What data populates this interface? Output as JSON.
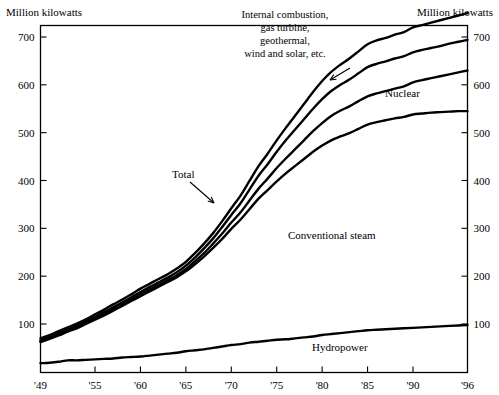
{
  "chart_data": {
    "type": "line",
    "title": "",
    "subtitle": "",
    "xlabel": "",
    "ylabel": "Million kilowatts",
    "ylabel_right": "Million kilowatts",
    "xlim": [
      1949,
      1996
    ],
    "ylim": [
      0,
      740
    ],
    "grid": false,
    "legend_position": "inline-labels",
    "ytick_labels": [
      "700",
      "600",
      "500",
      "400",
      "300",
      "200",
      "100"
    ],
    "ytick_values": [
      700,
      600,
      500,
      400,
      300,
      200,
      100
    ],
    "xtick_labels": [
      "'49",
      "'55",
      "'60",
      "'65",
      "'70",
      "'75",
      "'80",
      "'85",
      "'90",
      "'96"
    ],
    "xtick_values": [
      1949,
      1955,
      1960,
      1965,
      1970,
      1975,
      1980,
      1985,
      1990,
      1996
    ],
    "x": [
      1949,
      1950,
      1951,
      1952,
      1953,
      1954,
      1955,
      1956,
      1957,
      1958,
      1959,
      1960,
      1961,
      1962,
      1963,
      1964,
      1965,
      1966,
      1967,
      1968,
      1969,
      1970,
      1971,
      1972,
      1973,
      1974,
      1975,
      1976,
      1977,
      1978,
      1979,
      1980,
      1981,
      1982,
      1983,
      1984,
      1985,
      1986,
      1987,
      1988,
      1989,
      1990,
      1991,
      1992,
      1993,
      1994,
      1995,
      1996
    ],
    "series": [
      {
        "name": "Total",
        "label": "Total",
        "values": [
          70,
          77,
          85,
          93,
          101,
          110,
          120,
          130,
          141,
          151,
          162,
          174,
          184,
          194,
          204,
          216,
          230,
          248,
          268,
          290,
          315,
          342,
          368,
          399,
          430,
          456,
          484,
          510,
          535,
          560,
          585,
          608,
          627,
          642,
          655,
          670,
          685,
          693,
          698,
          705,
          710,
          720,
          725,
          730,
          735,
          740,
          745,
          750
        ]
      },
      {
        "name": "Internal combustion, gas turbine, geothermal, wind and solar, etc.",
        "label": "Internal combustion,\ngas turbine,\ngeothermal,\nwind and solar, etc.",
        "values": [
          66,
          73,
          81,
          89,
          97,
          106,
          115,
          125,
          135,
          145,
          156,
          167,
          177,
          187,
          197,
          208,
          222,
          239,
          258,
          279,
          303,
          328,
          352,
          381,
          410,
          434,
          460,
          484,
          506,
          528,
          550,
          570,
          587,
          600,
          611,
          624,
          637,
          644,
          649,
          655,
          660,
          668,
          673,
          677,
          681,
          686,
          690,
          694
        ]
      },
      {
        "name": "Nuclear",
        "label": "Nuclear",
        "values": [
          64,
          71,
          79,
          86,
          94,
          103,
          112,
          121,
          131,
          141,
          151,
          162,
          172,
          182,
          192,
          202,
          215,
          231,
          248,
          268,
          289,
          312,
          333,
          358,
          383,
          404,
          426,
          446,
          465,
          484,
          503,
          520,
          535,
          546,
          555,
          566,
          576,
          582,
          587,
          592,
          597,
          605,
          610,
          614,
          618,
          622,
          626,
          630
        ]
      },
      {
        "name": "Conventional steam",
        "label": "Conventional steam",
        "values": [
          62,
          69,
          76,
          84,
          91,
          100,
          109,
          118,
          128,
          138,
          148,
          158,
          168,
          178,
          188,
          198,
          210,
          225,
          241,
          259,
          278,
          299,
          318,
          340,
          362,
          380,
          398,
          415,
          430,
          445,
          460,
          473,
          484,
          492,
          499,
          508,
          517,
          522,
          526,
          530,
          533,
          538,
          540,
          542,
          543,
          544,
          545,
          545
        ]
      },
      {
        "name": "Hydropower",
        "label": "Hydropower",
        "values": [
          18,
          19,
          21,
          24,
          24,
          25,
          26,
          27,
          28,
          30,
          31,
          32,
          34,
          36,
          38,
          40,
          43,
          45,
          47,
          50,
          53,
          56,
          58,
          61,
          63,
          65,
          67,
          68,
          70,
          72,
          74,
          77,
          79,
          81,
          83,
          85,
          87,
          88,
          89,
          90,
          91,
          92,
          93,
          94,
          95,
          96,
          97,
          98
        ]
      }
    ],
    "annotations": [
      {
        "name": "internal-combustion-annotation",
        "lines": [
          "Internal combustion,",
          "gas turbine,",
          "geothermal,",
          "wind and solar, etc."
        ]
      },
      {
        "name": "total-annotation",
        "text": "Total"
      },
      {
        "name": "nuclear-annotation",
        "text": "Nuclear"
      },
      {
        "name": "conventional-steam-annotation",
        "text": "Conventional steam"
      },
      {
        "name": "hydropower-annotation",
        "text": "Hydropower"
      }
    ],
    "colors": {
      "line": "#000000",
      "axis": "#000000",
      "background": "#ffffff"
    }
  }
}
